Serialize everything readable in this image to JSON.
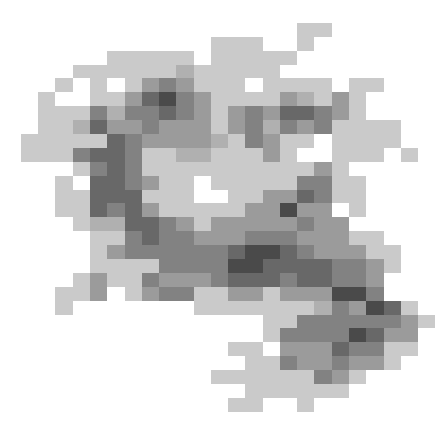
{
  "image": {
    "description": "Pixelated grayscale blot",
    "grid_cols": 25,
    "grid_rows": 30,
    "palette": {
      "0": "#ffffff",
      "1": "#cacaca",
      "2": "#b0b0b0",
      "3": "#9b9b9b",
      "4": "#828282",
      "5": "#686868",
      "6": "#4a4a4a"
    },
    "rows": [
      "0000000000000000000000000",
      "0000000000000000011000000",
      "0000000000001110010000000",
      "0000001111101111100000000",
      "0000111111211111000000000",
      "0001010134311101111011000",
      "0010011356431111321310000",
      "0011142445431343554310000",
      "0011253343331342434111100",
      "0111115433332143110111100",
      "0111455411221113100111010",
      "0000145411111111113100000",
      "0001055431101111144110000",
      "0001155511100113354110000",
      "0001154531111133633010000",
      "0000122554313333343300000",
      "0000011454433344433311000",
      "0000013444444566543331100",
      "0000011114444665555443100",
      "0000131143334555455443000",
      "0001130134411331333664000",
      "0001000000011111112436510",
      "0000000000000001144444431",
      "0000000000000001444465330",
      "0000000000000110333544110",
      "0000000000000011433433100",
      "0000000000001111114310000",
      "0000000000000011111100000",
      "0000000000000110010000000",
      "0000000000000000000000000"
    ]
  }
}
